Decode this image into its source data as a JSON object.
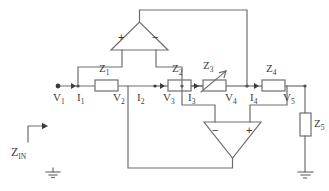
{
  "diagram": {
    "stroke_color": "#6e6e6e",
    "text_color": "#3b3b3b",
    "background": "#ffffff"
  },
  "impedances": [
    {
      "id": "Z1",
      "label": "Z",
      "sub": "1",
      "type": "resistor"
    },
    {
      "id": "Z2",
      "label": "Z",
      "sub": "2",
      "type": "resistor"
    },
    {
      "id": "Z3",
      "label": "Z",
      "sub": "3",
      "type": "variable-resistor"
    },
    {
      "id": "Z4",
      "label": "Z",
      "sub": "4",
      "type": "resistor"
    },
    {
      "id": "Z5",
      "label": "Z",
      "sub": "5",
      "type": "resistor"
    }
  ],
  "nodes": [
    {
      "id": "V1",
      "label": "V",
      "sub": "1"
    },
    {
      "id": "V2",
      "label": "V",
      "sub": "2"
    },
    {
      "id": "V3",
      "label": "V",
      "sub": "3"
    },
    {
      "id": "V4",
      "label": "V",
      "sub": "4"
    },
    {
      "id": "V5",
      "label": "V",
      "sub": "5"
    }
  ],
  "currents": [
    {
      "id": "I1",
      "label": "I",
      "sub": "1"
    },
    {
      "id": "I2",
      "label": "I",
      "sub": "2"
    },
    {
      "id": "I3",
      "label": "I",
      "sub": "3"
    },
    {
      "id": "I4",
      "label": "I",
      "sub": "4"
    }
  ],
  "opamps": [
    {
      "id": "A1",
      "position": "top",
      "left_terminal": "+",
      "right_terminal": "−"
    },
    {
      "id": "A2",
      "position": "bottom",
      "left_terminal": "−",
      "right_terminal": "+"
    }
  ],
  "input": {
    "label": "Z",
    "sub": "IN"
  },
  "grounds": [
    {
      "id": "gnd-left"
    },
    {
      "id": "gnd-right"
    }
  ]
}
